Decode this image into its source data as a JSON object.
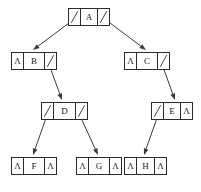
{
  "diagram": {
    "null_glyph": "Λ",
    "stroke_color": "#2b2b2b",
    "edge_color": "#3a3a3a",
    "background": "#ffffff",
    "node_cells": 3,
    "cell_roles": [
      "left-pointer",
      "data",
      "right-pointer"
    ]
  },
  "nodes": [
    {
      "id": "A",
      "label": "A",
      "level": 0,
      "x": 68,
      "y": 8,
      "width": 42,
      "left": "pointer",
      "right": "pointer",
      "left_child": "B",
      "right_child": "C"
    },
    {
      "id": "B",
      "label": "B",
      "level": 1,
      "x": 11,
      "y": 52,
      "width": 46,
      "left": "null",
      "right": "pointer",
      "left_child": null,
      "right_child": "D"
    },
    {
      "id": "C",
      "label": "C",
      "level": 1,
      "x": 124,
      "y": 52,
      "width": 46,
      "left": "null",
      "right": "pointer",
      "left_child": null,
      "right_child": "E"
    },
    {
      "id": "D",
      "label": "D",
      "level": 2,
      "x": 41,
      "y": 102,
      "width": 47,
      "left": "pointer",
      "right": "pointer",
      "left_child": "F",
      "right_child": "G"
    },
    {
      "id": "E",
      "label": "E",
      "level": 2,
      "x": 151,
      "y": 102,
      "width": 42,
      "left": "pointer",
      "right": "null",
      "left_child": "H",
      "right_child": null
    },
    {
      "id": "F",
      "label": "F",
      "level": 3,
      "x": 11,
      "y": 157,
      "width": 46,
      "left": "null",
      "right": "null",
      "left_child": null,
      "right_child": null
    },
    {
      "id": "G",
      "label": "G",
      "level": 3,
      "x": 76,
      "y": 157,
      "width": 46,
      "left": "null",
      "right": "null",
      "left_child": null,
      "right_child": null
    },
    {
      "id": "H",
      "label": "H",
      "level": 3,
      "x": 124,
      "y": 157,
      "width": 43,
      "left": "null",
      "right": "null",
      "left_child": null,
      "right_child": null
    }
  ],
  "edges": [
    {
      "from": "A",
      "from_side": "left",
      "to": "B",
      "x1": 73,
      "y1": 20,
      "x2": 33,
      "y2": 50
    },
    {
      "from": "A",
      "from_side": "right",
      "to": "C",
      "x1": 106,
      "y1": 20,
      "x2": 146,
      "y2": 50
    },
    {
      "from": "B",
      "from_side": "right",
      "to": "D",
      "x1": 50,
      "y1": 67,
      "x2": 62,
      "y2": 100
    },
    {
      "from": "C",
      "from_side": "right",
      "to": "E",
      "x1": 163,
      "y1": 67,
      "x2": 175,
      "y2": 100
    },
    {
      "from": "D",
      "from_side": "left",
      "to": "F",
      "x1": 46,
      "y1": 118,
      "x2": 33,
      "y2": 155
    },
    {
      "from": "D",
      "from_side": "right",
      "to": "G",
      "x1": 81,
      "y1": 118,
      "x2": 98,
      "y2": 155
    },
    {
      "from": "E",
      "from_side": "left",
      "to": "H",
      "x1": 157,
      "y1": 118,
      "x2": 144,
      "y2": 155
    }
  ]
}
